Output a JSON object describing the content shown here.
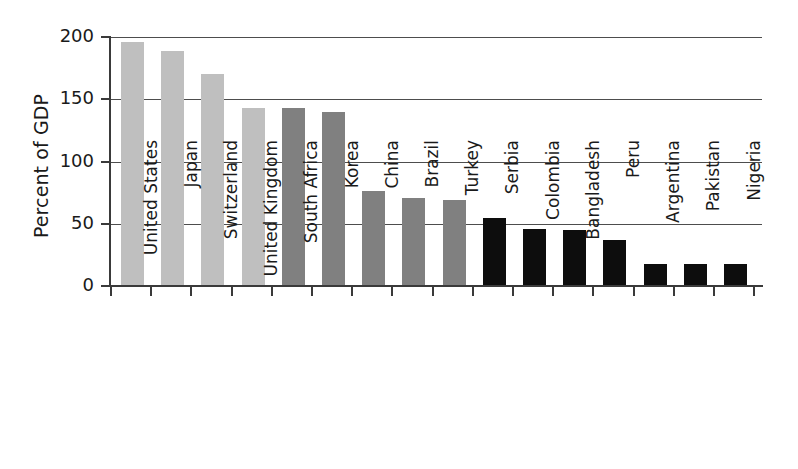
{
  "chart_data": {
    "type": "bar",
    "title": "",
    "subtitle": "",
    "xlabel": "",
    "ylabel": "Percent of GDP",
    "ylim": [
      0,
      200
    ],
    "yticks": [
      0,
      50,
      100,
      150,
      200
    ],
    "ytick_labels": [
      "0",
      "50",
      "100",
      "150",
      "200"
    ],
    "grid": "horizontal",
    "gridlines_at": [
      50,
      100,
      150,
      200
    ],
    "legend": "none",
    "legend_position": "none",
    "categories": [
      "United States",
      "Japan",
      "Switzerland",
      "United Kingdom",
      "South Africa",
      "Korea",
      "China",
      "Brazil",
      "Turkey",
      "Serbia",
      "Colombia",
      "Bangladesh",
      "Peru",
      "Argentina",
      "Pakistan",
      "Nigeria"
    ],
    "values": [
      196,
      189,
      170,
      143,
      143,
      140,
      76,
      71,
      69,
      55,
      46,
      45,
      37,
      18,
      18,
      18
    ],
    "bar_colors": [
      "#bfbfbf",
      "#bfbfbf",
      "#bfbfbf",
      "#bfbfbf",
      "#808080",
      "#808080",
      "#808080",
      "#808080",
      "#808080",
      "#0d0d0d",
      "#0d0d0d",
      "#0d0d0d",
      "#0d0d0d",
      "#0d0d0d",
      "#0d0d0d",
      "#0d0d0d"
    ],
    "color_groups": [
      {
        "shade": "light-gray",
        "hex": "#bfbfbf",
        "members": [
          "United States",
          "Japan",
          "Switzerland",
          "United Kingdom"
        ]
      },
      {
        "shade": "mid-gray",
        "hex": "#808080",
        "members": [
          "South Africa",
          "Korea",
          "China",
          "Brazil",
          "Turkey"
        ]
      },
      {
        "shade": "black",
        "hex": "#0d0d0d",
        "members": [
          "Serbia",
          "Colombia",
          "Bangladesh",
          "Peru",
          "Argentina",
          "Pakistan",
          "Nigeria"
        ]
      }
    ],
    "axis_color": "#3a3a3a",
    "gridline_color": "#4d4d4d",
    "background": "#ffffff"
  }
}
